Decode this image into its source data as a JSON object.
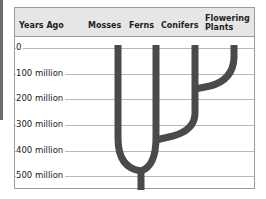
{
  "header": {
    "years_ago": "Years Ago",
    "columns": [
      "Mosses",
      "Ferns",
      "Conifers",
      "Flowering Plants"
    ],
    "flowering_line1": "Flowering",
    "flowering_line2": "Plants"
  },
  "rows": [
    "0",
    "100 million",
    "200 million",
    "300 million",
    "400 million",
    "500 million"
  ],
  "colors": {
    "branch": "#4a4a4a",
    "header_bg": "#e6e6e6",
    "grid": "#b8b8b8"
  },
  "tree": {
    "description": "Evolutionary branching of plant groups over time",
    "branch_points": [
      {
        "groups": [
          "Mosses",
          "Ferns/Conifers/Flowering Plants"
        ],
        "approx_years_ago": "450 million"
      },
      {
        "groups": [
          "Ferns",
          "Conifers/Flowering Plants"
        ],
        "approx_years_ago": "350 million"
      },
      {
        "groups": [
          "Conifers",
          "Flowering Plants"
        ],
        "approx_years_ago": "150 million"
      }
    ]
  }
}
